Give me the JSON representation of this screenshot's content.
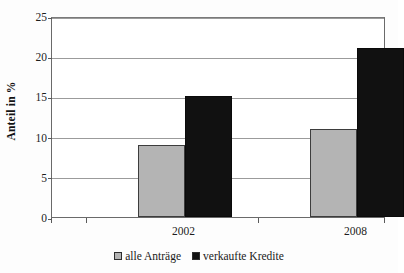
{
  "chart_data": {
    "type": "bar",
    "title": "",
    "subtitle": "",
    "xlabel": "",
    "ylabel": "Anteil in %",
    "categories": [
      "2002",
      "2008"
    ],
    "series": [
      {
        "name": "alle Anträge",
        "values": [
          9,
          11
        ],
        "color": "#b4b4b4"
      },
      {
        "name": "verkaufte Kredite",
        "values": [
          15,
          21
        ],
        "color": "#111111"
      }
    ],
    "ylim": [
      0,
      25
    ],
    "yticks": [
      0,
      5,
      10,
      15,
      20,
      25
    ],
    "ytick_labels": [
      "0",
      "5",
      "10",
      "15",
      "20",
      "25"
    ],
    "grid": true,
    "grid_axis": "y",
    "legend_position": "bottom",
    "note_series_mapping": "series[0] = 2002 group left bar and 2008 group left bar; series[1] = right bar of each group"
  },
  "legend": {
    "items": [
      {
        "label": "alle Anträge",
        "swatch": "gray-square-icon"
      },
      {
        "label": "verkaufte Kredite",
        "swatch": "black-square-icon"
      }
    ]
  },
  "axes": {
    "y_title": "Anteil in %",
    "y_tick_labels": [
      "25",
      "20",
      "15",
      "10",
      "5",
      "0"
    ],
    "x_tick_labels": [
      "2002",
      "2008"
    ]
  }
}
